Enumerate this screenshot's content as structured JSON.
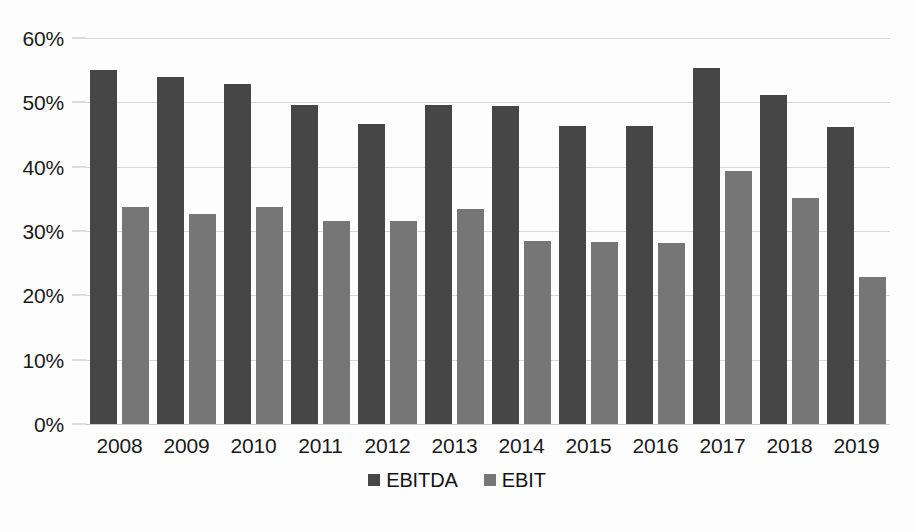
{
  "chart_data": {
    "type": "bar",
    "title": "",
    "subtitle": "",
    "xlabel": "",
    "ylabel": "",
    "ylim": [
      0,
      60
    ],
    "ytick_step": 10,
    "ytick_labels": [
      "60%",
      "50%",
      "40%",
      "30%",
      "20%",
      "10%",
      "0%"
    ],
    "ytick_values": [
      60,
      50,
      40,
      30,
      20,
      10,
      0
    ],
    "grid": true,
    "value_unit": "%",
    "legend_position": "bottom",
    "categories": [
      "2008",
      "2009",
      "2010",
      "2011",
      "2012",
      "2013",
      "2014",
      "2015",
      "2016",
      "2017",
      "2018",
      "2019"
    ],
    "series": [
      {
        "name": "EBITDA",
        "color": "#464646",
        "values": [
          55.1,
          53.9,
          52.8,
          49.6,
          46.7,
          49.6,
          49.5,
          46.4,
          46.4,
          55.4,
          51.2,
          46.2
        ]
      },
      {
        "name": "EBIT",
        "color": "#767676",
        "values": [
          33.8,
          32.7,
          33.7,
          31.6,
          31.5,
          33.4,
          28.4,
          28.3,
          28.2,
          39.3,
          35.1,
          22.9
        ]
      }
    ]
  },
  "legend": {
    "items": [
      {
        "label": "EBITDA",
        "color": "#464646"
      },
      {
        "label": "EBIT",
        "color": "#767676"
      }
    ]
  },
  "colors": {
    "ebitda": "#464646",
    "ebit": "#767676",
    "gridline": "#d8d8d8",
    "background": "#ffffff",
    "text": "#1a1a1a"
  }
}
